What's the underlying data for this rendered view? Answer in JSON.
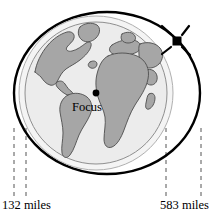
{
  "figure": {
    "name": "satellite-elliptical-orbit-diagram",
    "caption_left": "132 miles",
    "caption_right": "583 miles",
    "focus_label": "Focus",
    "icons": {
      "satellite": "satellite-icon",
      "focus_point": "focus-point-icon",
      "earth": "earth-globe-icon"
    },
    "colors": {
      "orbit_stroke": "#000000",
      "ocean_fill": "#ececec",
      "land_fill": "#a6a6a6",
      "land_stroke": "#4d4d4d",
      "halo_fill": "#f2f2f2",
      "halo_stroke": "#b3b3b3",
      "dash_stroke": "#555555",
      "background": "#ffffff",
      "text": "#000000"
    },
    "geometry": {
      "orbit_center_x": 107,
      "orbit_center_y": 93,
      "orbit_radius_x": 93,
      "orbit_radius_y": 81,
      "globe_center_x": 96,
      "globe_center_y": 93,
      "globe_radius": 71,
      "halo_radius": 77,
      "focus_x": 96,
      "focus_y": 93,
      "satellite_x": 177,
      "satellite_y": 41,
      "dash_x_positions": [
        14,
        26,
        166,
        201
      ],
      "dash_top_y": 130,
      "dash_bottom_y": 196
    }
  }
}
